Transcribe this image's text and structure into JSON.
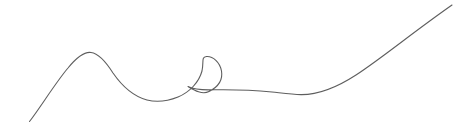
{
  "canvas": {
    "width": 462,
    "height": 132,
    "background_color": "#ffffff",
    "title": "single-line continuous curve with loop"
  },
  "artwork": {
    "name": "continuous-line-curve",
    "description": "One continuous thin line rising from lower-left to a rounded hump, descending into a shallow trough, forming a small vertical loop, then sweeping upward to the top-right corner",
    "stroke_color": "#555555",
    "stroke_width": 1.1,
    "stroke_opacity": 0.95,
    "path_d": "M 29.5 121.5 C 40 108 56 82 68 68 C 77 57 84 51.5 91 52.5 C 99 53.5 106 62 113 73 C 122 86 132 96 147 100 C 157 102.5 168 101 178 97 C 190 92 199 82 202 71 C 204 62 201 57 206.5 56.5 C 213 56 220 62.5 221.5 71 C 223 80 218 87 209 91.5 C 202 95 194 90 188 86.5 C 196 90.5 205 90 213.5 89.8 C 232 89.5 252 90 272 92 C 283 93.2 292 94.5 301 94.6 C 318 94.8 336 88 356 75 C 382 58 412 33 452 5",
    "key_points": {
      "start": [
        29.5,
        121.5
      ],
      "hump_peak": [
        89,
        52
      ],
      "trough": [
        158,
        101
      ],
      "loop_top": [
        212,
        57
      ],
      "loop_left": [
        198,
        72
      ],
      "loop_right": [
        222,
        72
      ],
      "loop_crossing": [
        213,
        90
      ],
      "post_loop_low": [
        298,
        95
      ],
      "end": [
        452,
        5
      ]
    }
  }
}
